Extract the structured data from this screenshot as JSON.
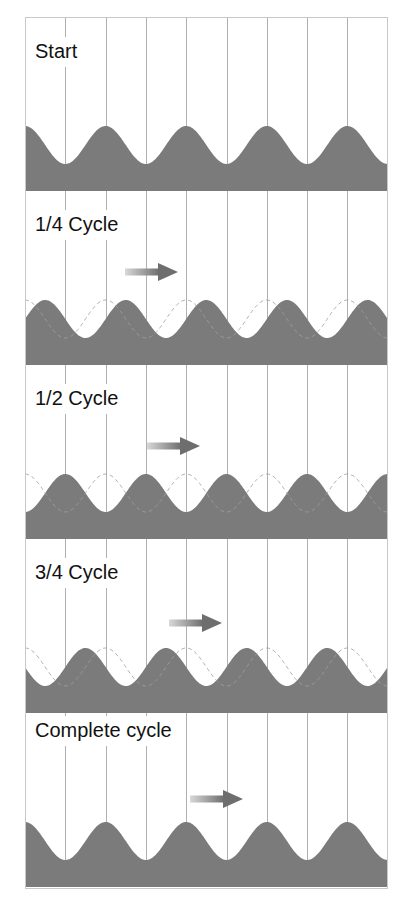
{
  "diagram": {
    "colors": {
      "wave_fill": "#7b7b7b",
      "grid_line": "#b0b0b0",
      "ghost_wave": "#a0a0a0",
      "arrow": "#6e6e6e",
      "background": "#ffffff"
    },
    "grid": {
      "columns": 9,
      "column_width_px": 40.3
    },
    "wavelength_columns": 2,
    "panels": [
      {
        "label": "Start",
        "phase_fraction": 0,
        "show_ghost": false,
        "arrow": null,
        "label_top": 20
      },
      {
        "label": "1/4 Cycle",
        "phase_fraction": 0.25,
        "show_ghost": true,
        "arrow": {
          "x_tail": 100,
          "x_tip": 153,
          "y": 81
        },
        "label_top": 19
      },
      {
        "label": "1/2 Cycle",
        "phase_fraction": 0.5,
        "show_ghost": true,
        "arrow": {
          "x_tail": 122,
          "x_tip": 175,
          "y": 81
        },
        "label_top": 19
      },
      {
        "label": "3/4 Cycle",
        "phase_fraction": 0.75,
        "show_ghost": true,
        "arrow": {
          "x_tail": 144,
          "x_tip": 197,
          "y": 84
        },
        "label_top": 19
      },
      {
        "label": "Complete cycle",
        "phase_fraction": 1,
        "show_ghost": false,
        "arrow": {
          "x_tail": 165,
          "x_tip": 218,
          "y": 86
        },
        "label_top": 3
      }
    ]
  }
}
